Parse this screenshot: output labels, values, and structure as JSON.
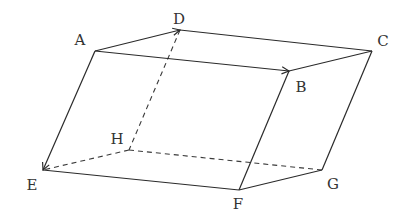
{
  "figure": {
    "type": "parallelepiped",
    "vertices": {
      "A": {
        "x": 95,
        "y": 51
      },
      "B": {
        "x": 289,
        "y": 71
      },
      "C": {
        "x": 372,
        "y": 51
      },
      "D": {
        "x": 180,
        "y": 30
      },
      "E": {
        "x": 43,
        "y": 170
      },
      "F": {
        "x": 239,
        "y": 190
      },
      "G": {
        "x": 322,
        "y": 170
      },
      "H": {
        "x": 129,
        "y": 150
      }
    },
    "labels": {
      "A": {
        "text": "A",
        "x": 80,
        "y": 40
      },
      "B": {
        "text": "B",
        "x": 301,
        "y": 87
      },
      "C": {
        "text": "C",
        "x": 383,
        "y": 41
      },
      "D": {
        "text": "D",
        "x": 179,
        "y": 19
      },
      "E": {
        "text": "E",
        "x": 32,
        "y": 185
      },
      "F": {
        "text": "F",
        "x": 238,
        "y": 204
      },
      "G": {
        "text": "G",
        "x": 333,
        "y": 184
      },
      "H": {
        "text": "H",
        "x": 117,
        "y": 139
      }
    },
    "solid_edges": [
      [
        "B",
        "C"
      ],
      [
        "C",
        "D"
      ],
      [
        "C",
        "G"
      ],
      [
        "B",
        "F"
      ],
      [
        "E",
        "F"
      ],
      [
        "F",
        "G"
      ]
    ],
    "vector_edges": [
      [
        "A",
        "D"
      ],
      [
        "A",
        "B"
      ],
      [
        "A",
        "E"
      ]
    ],
    "dashed_edges": [
      [
        "D",
        "H"
      ],
      [
        "H",
        "E"
      ],
      [
        "H",
        "G"
      ]
    ],
    "colors": {
      "line": "#2a2a2a",
      "label": "#333333",
      "background": "#ffffff"
    }
  }
}
